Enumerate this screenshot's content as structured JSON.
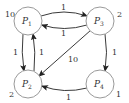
{
  "diagram": {
    "nodes": [
      {
        "id": "P1",
        "name": "P",
        "sub": "1",
        "weight": "10"
      },
      {
        "id": "P2",
        "name": "P",
        "sub": "2",
        "weight": "2"
      },
      {
        "id": "P3",
        "name": "P",
        "sub": "3",
        "weight": "2"
      },
      {
        "id": "P4",
        "name": "P",
        "sub": "4",
        "weight": "1"
      }
    ],
    "edges": [
      {
        "from": "P1",
        "to": "P3",
        "label": "1"
      },
      {
        "from": "P3",
        "to": "P1",
        "label": "1"
      },
      {
        "from": "P1",
        "to": "P2",
        "label": "1"
      },
      {
        "from": "P2",
        "to": "P1",
        "label": "1"
      },
      {
        "from": "P3",
        "to": "P2",
        "label": "10"
      },
      {
        "from": "P3",
        "to": "P4",
        "label": "1"
      },
      {
        "from": "P4",
        "to": "P2",
        "label": "1"
      }
    ],
    "colors": {
      "node_stroke": "#9a9a9a",
      "edge": "#3a3a3a",
      "text": "#333333"
    }
  }
}
